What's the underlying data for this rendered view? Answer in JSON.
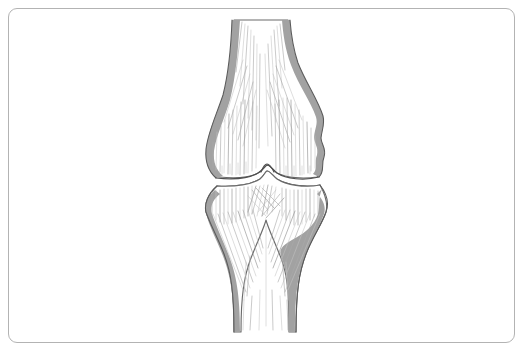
{
  "image": {
    "title": "Knee joint anatomical line illustration",
    "subject": "knee-joint",
    "view": "anterior",
    "style": "pen-and-ink line drawing with trabecular hatching",
    "has_text_labels": false,
    "background_color": "#ffffff",
    "width": 525,
    "height": 353
  },
  "frame": {
    "name": "rounded-border",
    "stroke_color": "#b3b3b3",
    "stroke_width": 1,
    "corner_radius": 9,
    "inset_left": 8,
    "inset_top": 8,
    "width": 507,
    "height": 335
  },
  "palette": {
    "cortex_fill": "#a2a2a2",
    "cortex_edge": "#5a5a5a",
    "bone_outline": "#6b6b6b",
    "bone_fill": "#ffffff",
    "hatch_light": "#c2c2c2",
    "hatch_mid": "#a9a9a9",
    "hatch_dark": "#8e8e8e",
    "joint_line": "#4f4f4f"
  },
  "structures": [
    {
      "id": "femur",
      "label": "Femur (distal)",
      "region": "upper",
      "description": "Shaft descending from top of frame, flaring into medial and lateral condyles",
      "top_y": 20,
      "bottom_y": 180,
      "shaft_left_x": 232,
      "shaft_right_x": 290,
      "widest_left_x": 207,
      "widest_right_x": 326
    },
    {
      "id": "tibia",
      "label": "Tibia (proximal)",
      "region": "lower",
      "description": "Broad plateau narrowing into shaft that exits the bottom of the frame",
      "top_y": 184,
      "bottom_y": 332,
      "plateau_left_x": 205,
      "plateau_right_x": 327,
      "shaft_left_x": 233,
      "shaft_right_x": 288
    },
    {
      "id": "joint-space",
      "label": "Joint space (articular cartilage gap)",
      "region": "middle",
      "description": "Thin white gap between femoral condyles and tibial plateau with central intercondylar eminence bump",
      "center_y": 176,
      "bump_center_x": 266
    },
    {
      "id": "intercondylar-notch",
      "label": "Intercondylar notch",
      "region": "upper-center",
      "description": "V-shaped gap between the two femoral shaft cortices at the top"
    },
    {
      "id": "cortex-left-femur",
      "label": "Femoral cortex, medial",
      "region": "upper-left"
    },
    {
      "id": "cortex-right-femur",
      "label": "Femoral cortex, lateral",
      "region": "upper-right"
    },
    {
      "id": "cortex-left-tibia",
      "label": "Tibial cortex, medial",
      "region": "lower-left"
    },
    {
      "id": "cortex-right-tibia",
      "label": "Tibial cortex, lateral",
      "region": "lower-right"
    }
  ],
  "chart_data": {
    "type": "line",
    "xlabel": "x (px)",
    "ylabel": "y (px)",
    "xlim": [
      190,
      340
    ],
    "ylim": [
      0,
      353
    ],
    "grid": false,
    "legend_position": "none",
    "series": [
      {
        "name": "femur-outer-left",
        "values": [
          [
            234,
            20
          ],
          [
            232,
            52
          ],
          [
            229,
            78
          ],
          [
            222,
            104
          ],
          [
            213,
            126
          ],
          [
            208,
            146
          ],
          [
            207,
            160
          ],
          [
            211,
            172
          ],
          [
            219,
            178
          ]
        ]
      },
      {
        "name": "femur-outer-right",
        "values": [
          [
            288,
            20
          ],
          [
            292,
            50
          ],
          [
            298,
            74
          ],
          [
            310,
            96
          ],
          [
            320,
            114
          ],
          [
            324,
            130
          ],
          [
            318,
            142
          ],
          [
            323,
            154
          ],
          [
            324,
            166
          ],
          [
            318,
            176
          ]
        ]
      },
      {
        "name": "femur-condyle-base",
        "values": [
          [
            219,
            178
          ],
          [
            244,
            176
          ],
          [
            258,
            172
          ],
          [
            266,
            166
          ],
          [
            276,
            172
          ],
          [
            292,
            177
          ],
          [
            318,
            176
          ]
        ]
      },
      {
        "name": "tibia-plateau-top",
        "values": [
          [
            217,
            186
          ],
          [
            243,
            183
          ],
          [
            258,
            180
          ],
          [
            266,
            174
          ],
          [
            276,
            180
          ],
          [
            294,
            184
          ],
          [
            320,
            185
          ]
        ]
      },
      {
        "name": "tibia-outer-left",
        "values": [
          [
            217,
            186
          ],
          [
            208,
            196
          ],
          [
            205,
            208
          ],
          [
            214,
            228
          ],
          [
            226,
            256
          ],
          [
            233,
            286
          ],
          [
            234,
            332
          ]
        ]
      },
      {
        "name": "tibia-outer-right",
        "values": [
          [
            320,
            185
          ],
          [
            327,
            198
          ],
          [
            326,
            212
          ],
          [
            316,
            234
          ],
          [
            300,
            262
          ],
          [
            291,
            292
          ],
          [
            289,
            332
          ]
        ]
      },
      {
        "name": "joint-space-gap",
        "values": [
          [
            219,
            181
          ],
          [
            248,
            179
          ],
          [
            262,
            174
          ],
          [
            268,
            169
          ],
          [
            280,
            176
          ],
          [
            300,
            181
          ],
          [
            318,
            180
          ]
        ]
      }
    ]
  }
}
